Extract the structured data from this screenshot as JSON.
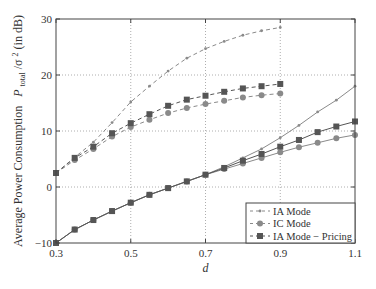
{
  "chart_data": {
    "type": "line",
    "title": "",
    "xlabel": "d",
    "ylabel": "Average Power Consumption  P_total/σ² (in dB)",
    "ylabel_parts": {
      "main": "Average Power Consumption",
      "sym": "P",
      "sub": "total",
      "rest": "/σ",
      "sup": "2",
      "unit": " (in dB)"
    },
    "xlim": [
      0.3,
      1.1
    ],
    "ylim": [
      -10,
      30
    ],
    "xticks": [
      0.3,
      0.5,
      0.7,
      0.9,
      1.1
    ],
    "xtick_labels": [
      "0.3",
      "0.5",
      "0.7",
      "0.9",
      "1.1"
    ],
    "yticks": [
      -10,
      0,
      10,
      20,
      30
    ],
    "ytick_labels": [
      "−10",
      "0",
      "10",
      "20",
      "30"
    ],
    "grid": true,
    "legend_position": "lower right",
    "legend": [
      {
        "label": "IA Mode",
        "marker": "dot",
        "color": "#8a8a8a"
      },
      {
        "label": "IC Mode",
        "marker": "circle",
        "color": "#8a8a8a"
      },
      {
        "label": "IA Mode − Pricing",
        "marker": "square",
        "color": "#555555"
      }
    ],
    "series": [
      {
        "name": "IA Mode (dashed)",
        "style": "dashed",
        "marker": "dot",
        "color": "#8a8a8a",
        "x": [
          0.3,
          0.35,
          0.4,
          0.45,
          0.5,
          0.55,
          0.6,
          0.65,
          0.7,
          0.75,
          0.8,
          0.85,
          0.9
        ],
        "values": [
          2.5,
          5.3,
          8.0,
          11.5,
          15.2,
          18.0,
          20.7,
          23.0,
          24.7,
          26.0,
          27.1,
          27.9,
          28.5
        ]
      },
      {
        "name": "IC Mode (dashed)",
        "style": "dashed",
        "marker": "circle",
        "color": "#8a8a8a",
        "x": [
          0.3,
          0.35,
          0.4,
          0.45,
          0.5,
          0.55,
          0.6,
          0.65,
          0.7,
          0.75,
          0.8,
          0.85,
          0.9
        ],
        "values": [
          2.5,
          4.8,
          6.8,
          9.0,
          10.7,
          12.0,
          13.2,
          14.1,
          14.8,
          15.4,
          16.0,
          16.4,
          16.7
        ]
      },
      {
        "name": "IA Mode − Pricing (dashed)",
        "style": "dashed",
        "marker": "square",
        "color": "#555555",
        "x": [
          0.3,
          0.35,
          0.4,
          0.45,
          0.5,
          0.55,
          0.6,
          0.65,
          0.7,
          0.75,
          0.8,
          0.85,
          0.9
        ],
        "values": [
          2.5,
          5.2,
          7.2,
          9.6,
          11.4,
          13.0,
          14.5,
          15.6,
          16.3,
          17.0,
          17.6,
          18.0,
          18.4
        ]
      },
      {
        "name": "IA Mode (solid)",
        "style": "solid",
        "marker": "dot",
        "color": "#8a8a8a",
        "x": [
          0.3,
          0.35,
          0.4,
          0.45,
          0.5,
          0.55,
          0.6,
          0.65,
          0.7,
          0.75,
          0.8,
          0.85,
          0.9,
          0.95,
          1.0,
          1.05,
          1.1
        ],
        "values": [
          -10,
          -7.6,
          -5.9,
          -4.3,
          -2.8,
          -1.4,
          -0.2,
          1.0,
          2.2,
          3.6,
          5.2,
          6.8,
          8.8,
          11.0,
          13.4,
          15.5,
          18.0
        ]
      },
      {
        "name": "IC Mode (solid)",
        "style": "solid",
        "marker": "circle",
        "color": "#8a8a8a",
        "x": [
          0.3,
          0.35,
          0.4,
          0.45,
          0.5,
          0.55,
          0.6,
          0.65,
          0.7,
          0.75,
          0.8,
          0.85,
          0.9,
          0.95,
          1.0,
          1.05,
          1.1
        ],
        "values": [
          -10,
          -7.6,
          -5.9,
          -4.3,
          -2.8,
          -1.4,
          -0.2,
          1.0,
          2.2,
          3.2,
          4.2,
          5.2,
          6.2,
          7.1,
          7.9,
          8.7,
          9.3
        ]
      },
      {
        "name": "IA Mode − Pricing (solid)",
        "style": "solid",
        "marker": "square",
        "color": "#555555",
        "x": [
          0.3,
          0.35,
          0.4,
          0.45,
          0.5,
          0.55,
          0.6,
          0.65,
          0.7,
          0.75,
          0.8,
          0.85,
          0.9,
          0.95,
          1.0,
          1.05,
          1.1
        ],
        "values": [
          -10,
          -7.6,
          -5.9,
          -4.3,
          -2.8,
          -1.4,
          -0.2,
          1.0,
          2.2,
          3.4,
          4.7,
          5.9,
          7.2,
          8.4,
          9.8,
          10.8,
          11.7
        ]
      }
    ]
  },
  "layout": {
    "plot_left": 56,
    "plot_right": 355,
    "plot_top": 19,
    "plot_bottom": 243,
    "legend": {
      "x": 246,
      "y": 203,
      "w": 109,
      "h": 40
    }
  }
}
